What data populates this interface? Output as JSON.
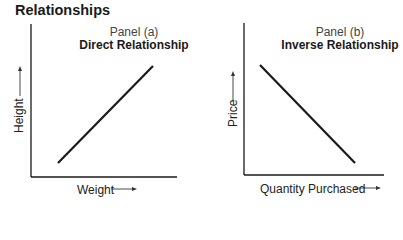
{
  "title": "Relationships",
  "panels": [
    {
      "label": "Panel (a)",
      "subtitle": "Direct Relationship",
      "xlabel": "Weight",
      "ylabel": "Height",
      "relationship": "direct"
    },
    {
      "label": "Panel (b)",
      "subtitle": "Inverse Relationship",
      "xlabel": "Quantity Purchased",
      "ylabel": "Price",
      "relationship": "inverse"
    }
  ],
  "colors": {
    "line": "#1a1a1a",
    "axis": "#1a1a1a",
    "text": "#1a1a1a"
  }
}
